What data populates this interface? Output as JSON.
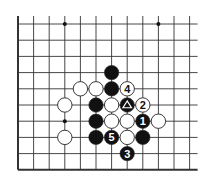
{
  "diagram": {
    "type": "go-board-fragment",
    "columns": 12,
    "rows": 10,
    "edges": {
      "left": true,
      "bottom": true,
      "top": false,
      "right": false
    },
    "colors": {
      "black_stone": "#111111",
      "white_stone": "#ffffff",
      "line": "#333333",
      "background": "#ffffff"
    },
    "star_points": [
      {
        "col": 3,
        "row": 0
      },
      {
        "col": 9,
        "row": 0
      },
      {
        "col": 3,
        "row": 6
      }
    ],
    "stones": [
      {
        "col": 6,
        "row": 3,
        "color": "black",
        "label": ""
      },
      {
        "col": 4,
        "row": 4,
        "color": "white",
        "label": ""
      },
      {
        "col": 5,
        "row": 4,
        "color": "white",
        "label": ""
      },
      {
        "col": 6,
        "row": 4,
        "color": "black",
        "label": ""
      },
      {
        "col": 7,
        "row": 4,
        "color": "white",
        "label": "4"
      },
      {
        "col": 3,
        "row": 5,
        "color": "white",
        "label": ""
      },
      {
        "col": 5,
        "row": 5,
        "color": "black",
        "label": ""
      },
      {
        "col": 6,
        "row": 5,
        "color": "white",
        "label": ""
      },
      {
        "col": 7,
        "row": 5,
        "color": "black",
        "label": "",
        "marker": "triangle"
      },
      {
        "col": 8,
        "row": 5,
        "color": "white",
        "label": "2"
      },
      {
        "col": 5,
        "row": 6,
        "color": "black",
        "label": ""
      },
      {
        "col": 6,
        "row": 6,
        "color": "white",
        "label": ""
      },
      {
        "col": 7,
        "row": 6,
        "color": "white",
        "label": ""
      },
      {
        "col": 8,
        "row": 6,
        "color": "black",
        "label": "1"
      },
      {
        "col": 9,
        "row": 6,
        "color": "white",
        "label": ""
      },
      {
        "col": 3,
        "row": 7,
        "color": "white",
        "label": ""
      },
      {
        "col": 5,
        "row": 7,
        "color": "black",
        "label": ""
      },
      {
        "col": 6,
        "row": 7,
        "color": "black",
        "label": "5"
      },
      {
        "col": 7,
        "row": 7,
        "color": "white",
        "label": ""
      },
      {
        "col": 8,
        "row": 7,
        "color": "black",
        "label": ""
      },
      {
        "col": 7,
        "row": 8,
        "color": "black",
        "label": "3"
      }
    ]
  }
}
